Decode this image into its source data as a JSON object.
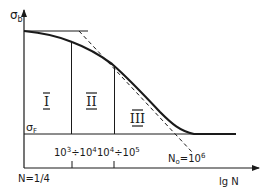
{
  "diagram": {
    "type": "fatigue-strength-curve",
    "y_axis": {
      "label_main": "σ",
      "label_sub": "b"
    },
    "x_axis": {
      "label": "lg N",
      "origin_label": "N=1/4"
    },
    "fatigue_limit": {
      "label_main": "σ",
      "label_sub": "F"
    },
    "regions": [
      {
        "label": "I"
      },
      {
        "label": "II"
      },
      {
        "label": "III"
      }
    ],
    "ticks": [
      {
        "base1": "10",
        "exp1": "3",
        "sep": "÷",
        "base2": "10",
        "exp2": "4"
      },
      {
        "base1": "10",
        "exp1": "4",
        "sep": "÷",
        "base2": "10",
        "exp2": "5"
      }
    ],
    "knee": {
      "n_main": "N",
      "n_sub": "o",
      "eq": "=10",
      "exp": "6"
    },
    "colors": {
      "ink": "#1a1a1a",
      "background": "#ffffff"
    }
  }
}
